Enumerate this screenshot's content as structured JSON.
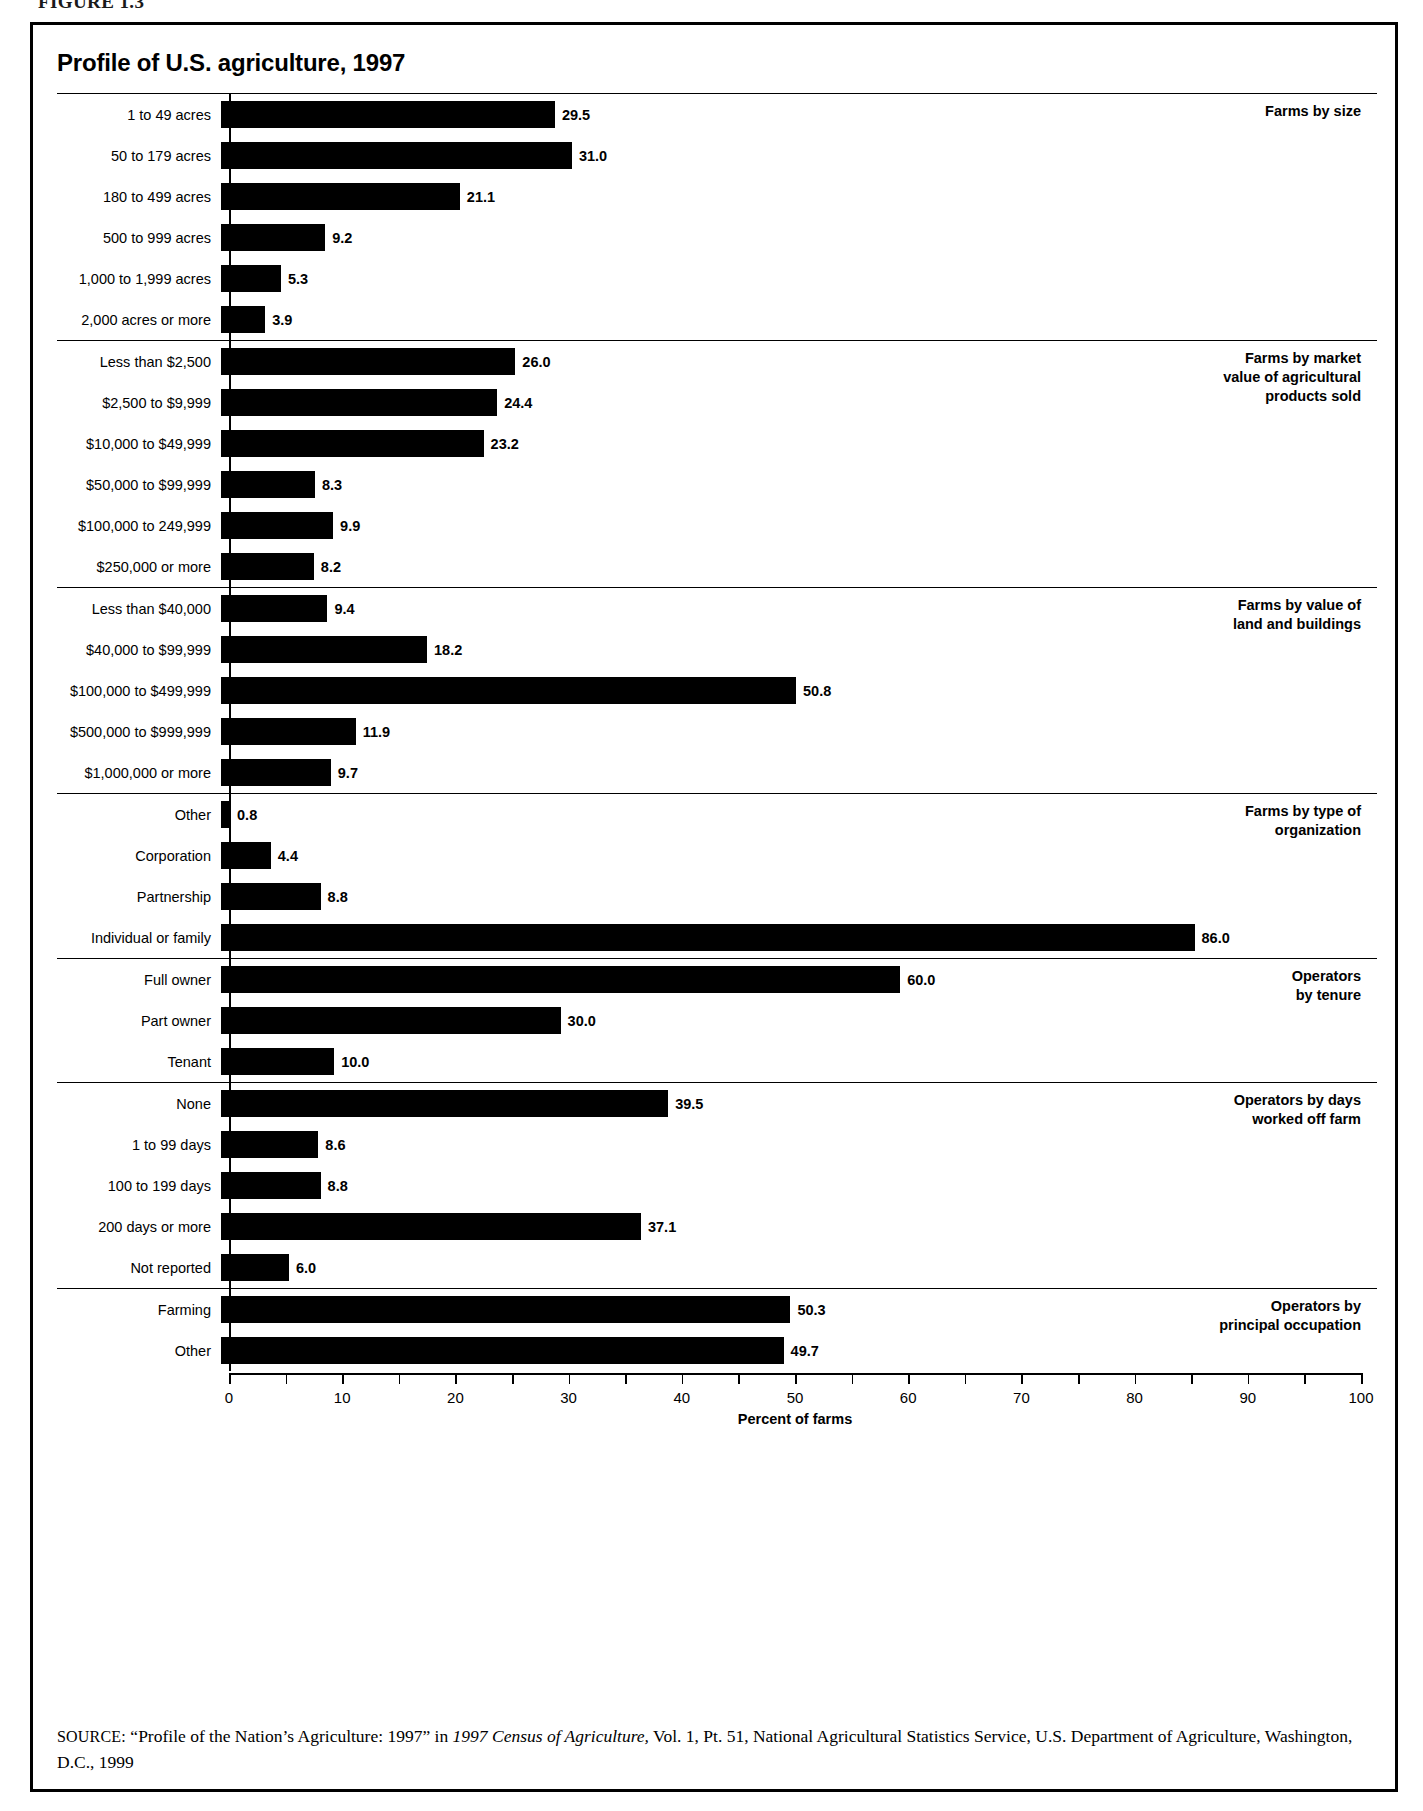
{
  "figure": {
    "number": "FIGURE 1.3",
    "title": "Profile of U.S. agriculture, 1997"
  },
  "source_note": {
    "label": "SOURCE:",
    "text_part1": " “Profile of the Nation’s Agriculture: 1997” in ",
    "italic1": "1997 Census of Agriculture,",
    "text_part2": " Vol. 1, Pt. 51, National Agricultural Statistics Service, U.S. Department of Agriculture, Washington, D.C., 1999"
  },
  "chart_data": {
    "type": "bar",
    "orientation": "horizontal",
    "title": "Profile of U.S. agriculture, 1997",
    "xlabel": "Percent of farms",
    "ylabel": "",
    "xlim": [
      0,
      100
    ],
    "xticks": [
      0,
      10,
      20,
      30,
      40,
      50,
      60,
      70,
      80,
      90,
      100
    ],
    "xtick_labels": [
      "0",
      "10",
      "20",
      "30",
      "40",
      "50",
      "60",
      "70",
      "80",
      "90",
      "100"
    ],
    "minor_ticks": [
      5,
      15,
      25,
      35,
      45,
      55,
      65,
      75,
      85,
      95
    ],
    "grid": false,
    "legend": "none",
    "bar_color": "#000000",
    "groups": [
      {
        "heading": "Farms by size",
        "categories": [
          "1 to 49 acres",
          "50 to 179 acres",
          "180 to 499 acres",
          "500 to 999 acres",
          "1,000 to 1,999 acres",
          "2,000 acres or more"
        ],
        "values": [
          29.5,
          31.0,
          21.1,
          9.2,
          5.3,
          3.9
        ],
        "labels": [
          "29.5",
          "31.0",
          "21.1",
          "9.2",
          "5.3",
          "3.9"
        ]
      },
      {
        "heading": "Farms by market\nvalue of agricultural\nproducts sold",
        "categories": [
          "Less than $2,500",
          "$2,500 to $9,999",
          "$10,000 to $49,999",
          "$50,000 to $99,999",
          "$100,000 to 249,999",
          "$250,000 or more"
        ],
        "values": [
          26.0,
          24.4,
          23.2,
          8.3,
          9.9,
          8.2
        ],
        "labels": [
          "26.0",
          "24.4",
          "23.2",
          "8.3",
          "9.9",
          "8.2"
        ]
      },
      {
        "heading": "Farms by value of\nland and buildings",
        "categories": [
          "Less than $40,000",
          "$40,000 to $99,999",
          "$100,000 to $499,999",
          "$500,000 to $999,999",
          "$1,000,000 or more"
        ],
        "values": [
          9.4,
          18.2,
          50.8,
          11.9,
          9.7
        ],
        "labels": [
          "9.4",
          "18.2",
          "50.8",
          "11.9",
          "9.7"
        ]
      },
      {
        "heading": "Farms by type of\norganization",
        "categories": [
          "Other",
          "Corporation",
          "Partnership",
          "Individual or family"
        ],
        "values": [
          0.8,
          4.4,
          8.8,
          86.0
        ],
        "labels": [
          "0.8",
          "4.4",
          "8.8",
          "86.0"
        ]
      },
      {
        "heading": "Operators\nby tenure",
        "categories": [
          "Full owner",
          "Part owner",
          "Tenant"
        ],
        "values": [
          60.0,
          30.0,
          10.0
        ],
        "labels": [
          "60.0",
          "30.0",
          "10.0"
        ]
      },
      {
        "heading": "Operators by days\nworked off farm",
        "categories": [
          "None",
          "1 to 99 days",
          "100 to 199 days",
          "200 days or more",
          "Not reported"
        ],
        "values": [
          39.5,
          8.6,
          8.8,
          37.1,
          6.0
        ],
        "labels": [
          "39.5",
          "8.6",
          "8.8",
          "37.1",
          "6.0"
        ]
      },
      {
        "heading": "Operators by\nprincipal occupation",
        "categories": [
          "Farming",
          "Other"
        ],
        "values": [
          50.3,
          49.7
        ],
        "labels": [
          "50.3",
          "49.7"
        ]
      }
    ]
  }
}
